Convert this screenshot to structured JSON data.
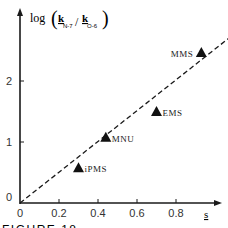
{
  "chart_data": {
    "type": "scatter",
    "title": "",
    "ylabel": "log(k_N-7 / k_O-6)",
    "ylabel_parts": {
      "prefix": "log",
      "num": "k",
      "num_sub": "N-7",
      "den": "k",
      "den_sub": "O-6"
    },
    "xlabel": "s",
    "xlim": [
      0,
      1.05
    ],
    "ylim": [
      0,
      2.75
    ],
    "x_ticks": [
      "0",
      "0.2",
      "0.4",
      "0.6",
      "0.8"
    ],
    "x_tick_values": [
      0,
      0.2,
      0.4,
      0.6,
      0.8
    ],
    "y_ticks": [
      "0",
      "1",
      "2"
    ],
    "y_tick_values": [
      0,
      1,
      2
    ],
    "grid": false,
    "points": [
      {
        "label": "iPMS",
        "x": 0.3,
        "y": 0.57
      },
      {
        "label": "MNU",
        "x": 0.44,
        "y": 1.07
      },
      {
        "label": "EMS",
        "x": 0.7,
        "y": 1.49
      },
      {
        "label": "MMS",
        "x": 0.93,
        "y": 2.46
      }
    ],
    "fit_line": {
      "style": "dashed",
      "x": [
        0,
        1.07
      ],
      "y": [
        0,
        2.7
      ]
    }
  },
  "caption": "FIGURE 18"
}
